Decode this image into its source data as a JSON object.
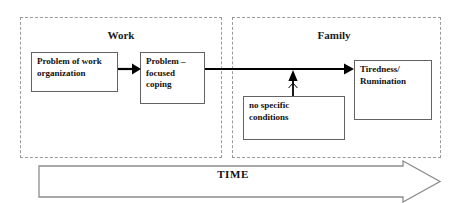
{
  "figure": {
    "time_axis_label": "TIME",
    "colors": {
      "region_border": "#9a9a9a",
      "node_border": "#636363",
      "arrow": "#000000",
      "text": "#111111",
      "background": "#ffffff"
    }
  },
  "regions": [
    {
      "id": "work",
      "label": "Work",
      "x": 20,
      "y": 17,
      "w": 202,
      "h": 141
    },
    {
      "id": "family",
      "label": "Family",
      "x": 232,
      "y": 17,
      "w": 209,
      "h": 141
    }
  ],
  "nodes": [
    {
      "id": "problem-of-work-organization",
      "label": "Problem of work\norganization",
      "x": 31,
      "y": 52,
      "w": 87,
      "h": 40
    },
    {
      "id": "problem-focused-coping",
      "label": "Problem –\nfocused\ncoping",
      "x": 140,
      "y": 52,
      "w": 65,
      "h": 52
    },
    {
      "id": "no-specific-conditions",
      "label": "no specific\nconditions",
      "x": 243,
      "y": 96,
      "w": 102,
      "h": 44
    },
    {
      "id": "tiredness-rumination",
      "label": "Tiredness/\nRumination",
      "x": 354,
      "y": 60,
      "w": 78,
      "h": 60
    }
  ],
  "arrows": [
    {
      "id": "arrow-problem-to-coping",
      "from": "problem-of-work-organization",
      "to": "problem-focused-coping",
      "orientation": "horizontal",
      "x1": 118,
      "y1": 69,
      "x2": 139,
      "y2": 69
    },
    {
      "id": "arrow-coping-to-tiredness",
      "from": "problem-focused-coping",
      "to": "tiredness-rumination",
      "orientation": "horizontal",
      "x1": 205,
      "y1": 69,
      "x2": 353,
      "y2": 69
    },
    {
      "id": "arrow-conditions-to-spillover",
      "from": "no-specific-conditions",
      "to": "arrow-coping-to-tiredness",
      "orientation": "vertical-up",
      "x1": 293,
      "y1": 96,
      "x2": 293,
      "y2": 70
    }
  ]
}
